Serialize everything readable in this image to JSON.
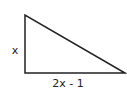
{
  "diagram": {
    "type": "right-triangle",
    "labels": {
      "vertical_leg": "x",
      "horizontal_leg": "2x - 1"
    },
    "vertices": {
      "top": [
        25,
        15
      ],
      "bottom_left": [
        25,
        73
      ],
      "bottom_right": [
        125,
        73
      ]
    },
    "stroke_color": "#222222"
  }
}
